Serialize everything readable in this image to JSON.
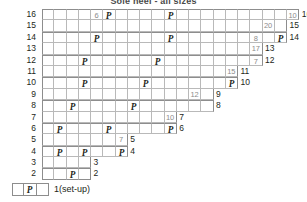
{
  "title": "Sole heel - all sizes",
  "legend": {
    "symbol": "P",
    "label": "1(set-up)",
    "cell_count": 3,
    "symbol_index": 1
  },
  "chart_data": {
    "type": "table",
    "title": "Sole heel - all sizes",
    "cell_width_px": 12.25,
    "row_height_px": 11.4,
    "symbol": "P",
    "rows": [
      {
        "label": "16",
        "end_label": "16",
        "cells": 21,
        "content": [
          {
            "i": 4,
            "v": "6"
          },
          {
            "i": 5,
            "v": "P"
          },
          {
            "i": 10,
            "v": "P"
          },
          {
            "i": 20,
            "v": "10"
          }
        ]
      },
      {
        "label": "15",
        "end_label": "15",
        "cells": 20,
        "content": [
          {
            "i": 18,
            "v": "20"
          }
        ]
      },
      {
        "label": "14",
        "end_label": "14",
        "cells": 20,
        "content": [
          {
            "i": 4,
            "v": "P"
          },
          {
            "i": 10,
            "v": "P"
          },
          {
            "i": 17,
            "v": "8"
          },
          {
            "i": 19,
            "v": "P"
          }
        ]
      },
      {
        "label": "13",
        "end_label": "13",
        "cells": 18,
        "content": [
          {
            "i": 17,
            "v": "17"
          }
        ]
      },
      {
        "label": "12",
        "end_label": "12",
        "cells": 18,
        "content": [
          {
            "i": 3,
            "v": "P"
          },
          {
            "i": 9,
            "v": "P"
          },
          {
            "i": 17,
            "v": "7"
          }
        ]
      },
      {
        "label": "11",
        "end_label": "11",
        "cells": 16,
        "content": [
          {
            "i": 15,
            "v": "15"
          }
        ]
      },
      {
        "label": "10",
        "end_label": "10",
        "cells": 16,
        "content": [
          {
            "i": 3,
            "v": "P"
          },
          {
            "i": 8,
            "v": "P"
          },
          {
            "i": 15,
            "v": "P"
          }
        ]
      },
      {
        "label": "9",
        "end_label": "9",
        "cells": 14,
        "content": [
          {
            "i": 12,
            "v": "12"
          }
        ]
      },
      {
        "label": "8",
        "end_label": "8",
        "cells": 14,
        "content": [
          {
            "i": 2,
            "v": "P"
          },
          {
            "i": 7,
            "v": "P"
          }
        ]
      },
      {
        "label": "7",
        "end_label": "7",
        "cells": 11,
        "content": [
          {
            "i": 10,
            "v": "10"
          }
        ]
      },
      {
        "label": "6",
        "end_label": "6",
        "cells": 11,
        "content": [
          {
            "i": 1,
            "v": "P"
          },
          {
            "i": 5,
            "v": "P"
          },
          {
            "i": 10,
            "v": "P"
          }
        ]
      },
      {
        "label": "5",
        "end_label": "5",
        "cells": 7,
        "content": [
          {
            "i": 6,
            "v": "7"
          }
        ]
      },
      {
        "label": "4",
        "end_label": "4",
        "cells": 7,
        "content": [
          {
            "i": 1,
            "v": "P"
          },
          {
            "i": 3,
            "v": "P"
          },
          {
            "i": 6,
            "v": "P"
          }
        ]
      },
      {
        "label": "3",
        "end_label": "3",
        "cells": 4,
        "content": []
      },
      {
        "label": "2",
        "end_label": "2",
        "cells": 4,
        "content": [
          {
            "i": 2,
            "v": "P"
          }
        ]
      }
    ]
  }
}
